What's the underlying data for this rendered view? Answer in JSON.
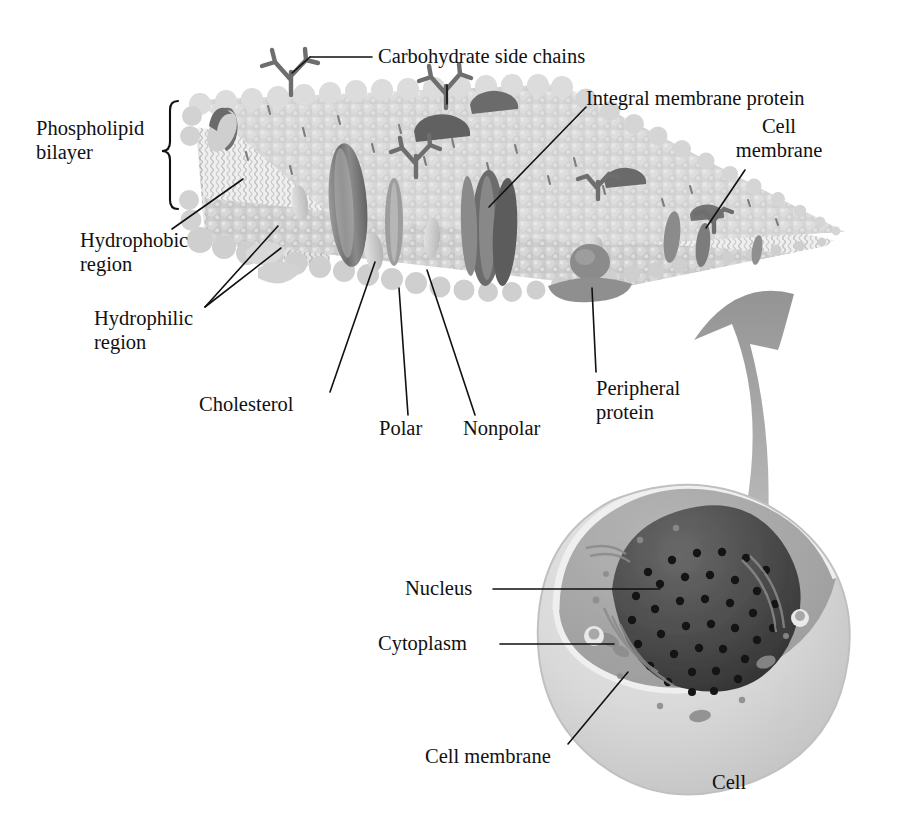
{
  "figure": {
    "background": "#ffffff",
    "ink": "#111111",
    "palette": {
      "head_group": "#c9c9c9",
      "head_group_light": "#d8d8d8",
      "tail_region": "#ededed",
      "tail_wave": "#c4c4c4",
      "protein_mid": "#8d8d8d",
      "protein_dark": "#6f6f6f",
      "protein_darkest": "#575757",
      "cholesterol": "#cfcfcf",
      "carb_chain": "#6e6e6e",
      "arrow_gray": "#9a9a9a",
      "cell_outer": "#d6d6d6",
      "cytoplasm": "#a8a8a8",
      "nucleus": "#4a4a4a",
      "nucleus_pore": "#1c1c1c"
    }
  },
  "labels": {
    "carbohydrate_side_chains": "Carbohydrate side chains",
    "integral_membrane_protein": "Integral membrane protein",
    "cell_membrane_top": "Cell\nmembrane",
    "phospholipid_bilayer": "Phospholipid\nbilayer",
    "hydrophobic_region": "Hydrophobic\nregion",
    "hydrophilic_region": "Hydrophilic\nregion",
    "cholesterol": "Cholesterol",
    "polar": "Polar",
    "nonpolar": "Nonpolar",
    "peripheral_protein": "Peripheral\nprotein",
    "nucleus": "Nucleus",
    "cytoplasm": "Cytoplasm",
    "cell_membrane_bottom": "Cell membrane",
    "cell": "Cell"
  },
  "parts": {
    "membrane_slab": "phospholipid-bilayer-slab",
    "bracket": "phospholipid-bilayer-bracket",
    "zoom_arrow": "magnification-arrow",
    "cell_body": "cell-body",
    "nucleus_shape": "nucleus",
    "cytoplasm_shape": "cytoplasm"
  }
}
